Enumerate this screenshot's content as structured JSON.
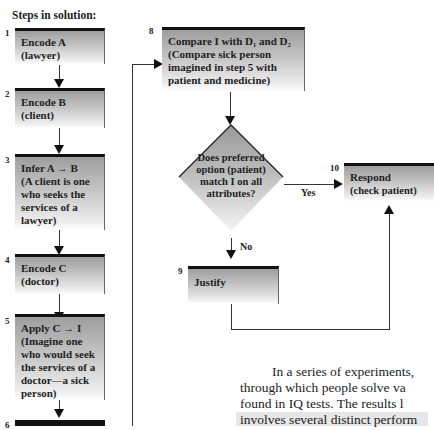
{
  "heading": "Steps in solution:",
  "steps": [
    {
      "num": "1",
      "title": "Encode A",
      "detail": "(lawyer)"
    },
    {
      "num": "2",
      "title": "Encode B",
      "detail": "(client)"
    },
    {
      "num": "3",
      "title": "Infer A → B",
      "detail": "(A client is one who seeks the services of a lawyer)"
    },
    {
      "num": "4",
      "title": "Encode C",
      "detail": "(doctor)"
    },
    {
      "num": "5",
      "title": "Apply C → I",
      "detail": "(Imagine one who would seek the services of a doctor—a sick person)"
    },
    {
      "num": "6",
      "title": "",
      "detail": ""
    },
    {
      "num": "8",
      "title": "Compare I with D₁ and D₂",
      "detail": "(Compare sick person imagined in step 5 with patient and medicine)"
    },
    {
      "num": "9",
      "title": "Justify",
      "detail": ""
    },
    {
      "num": "10",
      "title": "Respond",
      "detail": "(check patient)"
    }
  ],
  "decision": {
    "text": "Does preferred option (patient) match I on all attributes?",
    "yes_label": "Yes",
    "no_label": "No"
  },
  "body_text": {
    "lines": [
      "In a series of experiments,",
      "through which people solve va",
      "found in IQ tests. The results l",
      "involves several distinct perform"
    ]
  }
}
